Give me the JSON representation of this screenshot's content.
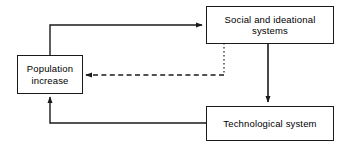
{
  "diagram": {
    "type": "flow-diagram",
    "title": "",
    "background_color": "#ffffff",
    "line_color": "#1a1a1a",
    "text_color": "#000000",
    "nodes": [
      {
        "id": "social",
        "label": "Social and ideational\nsystems",
        "x": 206,
        "y": 6,
        "width": 128,
        "height": 38
      },
      {
        "id": "population",
        "label": "Population\nincrease",
        "x": 17,
        "y": 55,
        "width": 66,
        "height": 39
      },
      {
        "id": "technological",
        "label": "Technological system",
        "x": 206,
        "y": 106,
        "width": 128,
        "height": 35
      }
    ],
    "edges": [
      {
        "id": "population-to-social",
        "from": "population",
        "to": "social",
        "style": "solid",
        "arrow": "end",
        "path": "M 50 55 L 50 25 L 202 25"
      },
      {
        "id": "social-to-population",
        "from": "social",
        "to": "population",
        "style": "dashed",
        "arrow": "end",
        "path": "M 224 43 L 224 75 L 86 75"
      },
      {
        "id": "social-to-technological",
        "from": "social",
        "to": "technological",
        "style": "solid",
        "arrow": "end",
        "path": "M 268 43 L 268 102"
      },
      {
        "id": "technological-to-population",
        "from": "technological",
        "to": "population",
        "style": "solid",
        "arrow": "end",
        "path": "M 206 123 L 50 123 L 50 97"
      }
    ]
  }
}
